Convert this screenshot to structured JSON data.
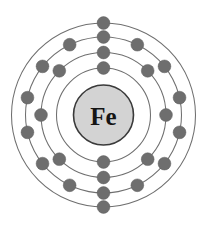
{
  "figure": {
    "kind": "bohr-model-diagram",
    "element_symbol": "Fe",
    "element_name": "Iron",
    "atomic_number": 26,
    "background_color": "#ffffff",
    "center": {
      "x": 103.5,
      "y": 115
    }
  },
  "nucleus": {
    "symbol": "Fe",
    "radius": 30,
    "fill_color": "#d3d3d3",
    "stroke_color": "#3a3a3a",
    "text_color": "#151515",
    "font_size": 25
  },
  "style": {
    "shell_stroke_color": "#6f6f6f",
    "shell_stroke_width": 1.05,
    "electron_fill_color": "#6e6e6e",
    "electron_stroke_color": "#5e5e5e",
    "electron_radius": 6.4
  },
  "chart_data": {
    "type": "scatter",
    "title": "Fe",
    "subtitle": "Bohr model of the iron atom",
    "xlabel": "",
    "ylabel": "",
    "electron_configuration": [
      2,
      8,
      14,
      2
    ],
    "electron_configuration_text": "2, 8, 14, 2",
    "total_electrons": 26,
    "shells": [
      {
        "index": 1,
        "name": "K",
        "radius": 47,
        "electron_count": 2,
        "start_angle_deg": -90,
        "angles_deg": [
          -90,
          90
        ]
      },
      {
        "index": 2,
        "name": "L",
        "radius": 62.5,
        "electron_count": 8,
        "start_angle_deg": -90,
        "angles_deg": [
          -90,
          -45,
          0,
          45,
          90,
          135,
          180,
          225
        ]
      },
      {
        "index": 3,
        "name": "M",
        "radius": 78,
        "electron_count": 14,
        "start_angle_deg": -90,
        "angles_deg": [
          -90,
          -64.29,
          -38.57,
          -12.86,
          12.86,
          38.57,
          64.29,
          90,
          115.71,
          141.43,
          167.14,
          192.86,
          218.57,
          244.29
        ]
      },
      {
        "index": 4,
        "name": "N",
        "radius": 92,
        "electron_count": 2,
        "start_angle_deg": -90,
        "angles_deg": [
          -90,
          90
        ]
      }
    ]
  }
}
